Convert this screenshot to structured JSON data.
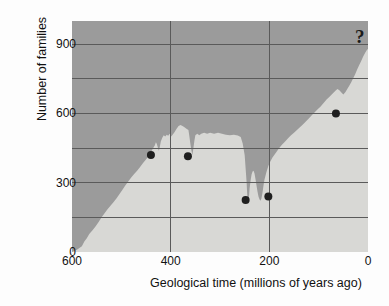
{
  "chart_data": {
    "type": "area",
    "title": "",
    "subtitle": "",
    "xlabel": "Geological time (millions of years ago)",
    "ylabel": "Number of families",
    "xlim": [
      600,
      0
    ],
    "ylim": [
      0,
      1000
    ],
    "x_reversed": true,
    "grid": true,
    "legend": null,
    "xticks": [
      600,
      400,
      200,
      0
    ],
    "xtick_labels": [
      "600",
      "400",
      "200",
      "0"
    ],
    "yticks": [
      0,
      300,
      600,
      900
    ],
    "ytick_labels": [
      "0",
      "300",
      "600",
      "900"
    ],
    "y_gridlines": [
      0,
      150,
      300,
      450,
      600,
      750,
      900
    ],
    "x_gridlines": [
      400,
      200
    ],
    "annotations": [
      {
        "name": "uncertainty-marker",
        "text": "?",
        "x": 10,
        "y": 880
      }
    ],
    "series": [
      {
        "name": "Number of marine and continental families",
        "kind": "area",
        "fill_color": "#d8d8d5",
        "background_color": "#9b9b9b",
        "points": [
          [
            600,
            0
          ],
          [
            590,
            10
          ],
          [
            580,
            25
          ],
          [
            575,
            45
          ],
          [
            570,
            60
          ],
          [
            565,
            78
          ],
          [
            558,
            95
          ],
          [
            552,
            112
          ],
          [
            546,
            130
          ],
          [
            540,
            150
          ],
          [
            534,
            168
          ],
          [
            528,
            185
          ],
          [
            522,
            200
          ],
          [
            516,
            215
          ],
          [
            510,
            232
          ],
          [
            504,
            250
          ],
          [
            498,
            268
          ],
          [
            492,
            288
          ],
          [
            486,
            305
          ],
          [
            480,
            322
          ],
          [
            474,
            338
          ],
          [
            468,
            352
          ],
          [
            462,
            368
          ],
          [
            456,
            385
          ],
          [
            450,
            400
          ],
          [
            444,
            418
          ],
          [
            440,
            432
          ],
          [
            436,
            448
          ],
          [
            432,
            462
          ],
          [
            430,
            475
          ],
          [
            428,
            468
          ],
          [
            426,
            452
          ],
          [
            424,
            438
          ],
          [
            422,
            455
          ],
          [
            420,
            478
          ],
          [
            417,
            495
          ],
          [
            414,
            505
          ],
          [
            411,
            500
          ],
          [
            408,
            508
          ],
          [
            405,
            503
          ],
          [
            402,
            512
          ],
          [
            399,
            500
          ],
          [
            396,
            508
          ],
          [
            392,
            520
          ],
          [
            388,
            534
          ],
          [
            384,
            545
          ],
          [
            380,
            550
          ],
          [
            376,
            545
          ],
          [
            372,
            540
          ],
          [
            368,
            534
          ],
          [
            364,
            528
          ],
          [
            362,
            500
          ],
          [
            360,
            468
          ],
          [
            358,
            440
          ],
          [
            356,
            420
          ],
          [
            354,
            448
          ],
          [
            352,
            480
          ],
          [
            350,
            505
          ],
          [
            346,
            512
          ],
          [
            342,
            505
          ],
          [
            338,
            512
          ],
          [
            332,
            516
          ],
          [
            326,
            512
          ],
          [
            320,
            516
          ],
          [
            312,
            512
          ],
          [
            304,
            516
          ],
          [
            296,
            512
          ],
          [
            288,
            508
          ],
          [
            280,
            505
          ],
          [
            272,
            508
          ],
          [
            264,
            504
          ],
          [
            258,
            498
          ],
          [
            254,
            470
          ],
          [
            250,
            420
          ],
          [
            248,
            360
          ],
          [
            246,
            300
          ],
          [
            245,
            255
          ],
          [
            244,
            222
          ],
          [
            243,
            208
          ],
          [
            242,
            218
          ],
          [
            241,
            245
          ],
          [
            240,
            275
          ],
          [
            238,
            310
          ],
          [
            236,
            335
          ],
          [
            234,
            348
          ],
          [
            232,
            352
          ],
          [
            230,
            340
          ],
          [
            228,
            315
          ],
          [
            226,
            288
          ],
          [
            224,
            262
          ],
          [
            222,
            240
          ],
          [
            220,
            228
          ],
          [
            218,
            222
          ],
          [
            216,
            232
          ],
          [
            214,
            255
          ],
          [
            212,
            285
          ],
          [
            210,
            312
          ],
          [
            206,
            345
          ],
          [
            202,
            372
          ],
          [
            198,
            392
          ],
          [
            194,
            408
          ],
          [
            190,
            420
          ],
          [
            186,
            432
          ],
          [
            180,
            450
          ],
          [
            174,
            465
          ],
          [
            168,
            478
          ],
          [
            162,
            492
          ],
          [
            156,
            505
          ],
          [
            150,
            516
          ],
          [
            144,
            528
          ],
          [
            138,
            540
          ],
          [
            132,
            552
          ],
          [
            126,
            565
          ],
          [
            120,
            578
          ],
          [
            114,
            592
          ],
          [
            108,
            605
          ],
          [
            102,
            618
          ],
          [
            96,
            630
          ],
          [
            90,
            645
          ],
          [
            84,
            660
          ],
          [
            78,
            672
          ],
          [
            72,
            685
          ],
          [
            66,
            698
          ],
          [
            62,
            706
          ],
          [
            58,
            700
          ],
          [
            54,
            690
          ],
          [
            50,
            682
          ],
          [
            46,
            692
          ],
          [
            42,
            706
          ],
          [
            38,
            720
          ],
          [
            34,
            735
          ],
          [
            30,
            752
          ],
          [
            26,
            770
          ],
          [
            22,
            790
          ],
          [
            18,
            808
          ],
          [
            14,
            826
          ],
          [
            10,
            845
          ],
          [
            6,
            862
          ],
          [
            3,
            872
          ],
          [
            0,
            880
          ]
        ]
      },
      {
        "name": "Mass extinction events",
        "kind": "scatter",
        "marker_color": "#1f1f1f",
        "marker_radius": 4,
        "points": [
          {
            "label": "End Ordovician",
            "x": 440,
            "y": 420
          },
          {
            "label": "Late Devonian",
            "x": 365,
            "y": 415
          },
          {
            "label": "End Permian",
            "x": 248,
            "y": 225
          },
          {
            "label": "End Triassic",
            "x": 202,
            "y": 240
          },
          {
            "label": "End Cretaceous",
            "x": 65,
            "y": 600
          }
        ]
      }
    ]
  },
  "axes": {
    "y_title": "Number of families",
    "x_title": "Geological time (millions of years ago)"
  },
  "colors": {
    "plot_background": "#9b9b9b",
    "area_fill": "#d8d8d5",
    "gridline": "#5a5a5a",
    "marker": "#1f1f1f",
    "text": "#111111",
    "page_background": "#fdfdfd"
  }
}
